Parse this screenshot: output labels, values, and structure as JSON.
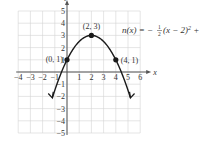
{
  "chart_data": {
    "type": "line",
    "title": "",
    "function_label": "n(x) = −½(x − 2)² + 3",
    "function_parts": {
      "lhs": "n(x) = −",
      "frac_num": "1",
      "frac_den": "2",
      "rhs_a": "(x − 2)",
      "exp": "2",
      "rhs_b": " + 3"
    },
    "xlabel": "x",
    "ylabel": "y",
    "xlim": [
      -4,
      6
    ],
    "ylim": [
      -5,
      5
    ],
    "grid": true,
    "x_ticks": [
      -4,
      -3,
      -2,
      -1,
      1,
      2,
      3,
      4,
      5,
      6
    ],
    "x_tick_labels": [
      "−4",
      "−3",
      "−2",
      "−1",
      "1",
      "2",
      "3",
      "4",
      "5",
      "6"
    ],
    "y_ticks": [
      -5,
      -4,
      -3,
      -2,
      -1,
      1,
      2,
      3,
      4,
      5
    ],
    "y_tick_labels": [
      "−5",
      "−4",
      "−3",
      "−2",
      "−1",
      "1",
      "2",
      "3",
      "4",
      "5"
    ],
    "series": [
      {
        "name": "n(x)",
        "equation": "-0.5*(x-2)^2+3",
        "x": [
          -1.2,
          -1,
          0,
          1,
          2,
          3,
          4,
          5,
          5.2
        ],
        "y": [
          -2.12,
          -1.5,
          1,
          2.5,
          3,
          2.5,
          1,
          -1.5,
          -2.12
        ]
      }
    ],
    "points": [
      {
        "x": 0,
        "y": 1,
        "label": "(0, 1)"
      },
      {
        "x": 2,
        "y": 3,
        "label": "(2, 3)"
      },
      {
        "x": 4,
        "y": 1,
        "label": "(4, 1)"
      }
    ]
  },
  "colors": {
    "grid": "#d4d4d4",
    "axis": "#555555",
    "curve": "#1a1a1a",
    "text": "#333333"
  }
}
